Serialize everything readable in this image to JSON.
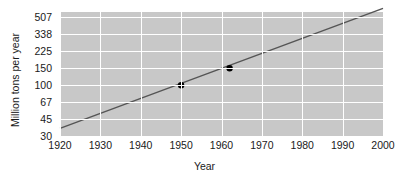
{
  "chart_data": {
    "type": "line",
    "title": "",
    "xlabel": "Year",
    "ylabel": "Million tons per year",
    "y_scale": "log",
    "x_scale": "linear",
    "grid": true,
    "legend": false,
    "xlim": [
      1920,
      2000
    ],
    "ylim": [
      30,
      570
    ],
    "xticks": [
      1920,
      1930,
      1940,
      1950,
      1960,
      1970,
      1980,
      1990,
      2000
    ],
    "xtick_labels": [
      "1920",
      "1930",
      "1940",
      "1950",
      "1960",
      "1970",
      "1980",
      "1990",
      "2000"
    ],
    "yticks": [
      30,
      45,
      67,
      100,
      150,
      225,
      338,
      507
    ],
    "ytick_labels": [
      "30",
      "45",
      "67",
      "100",
      "150",
      "225",
      "338",
      "507"
    ],
    "series": [
      {
        "name": "trend",
        "kind": "line",
        "color": "#555555",
        "x": [
          1920,
          2000
        ],
        "values": [
          36,
          620
        ]
      },
      {
        "name": "data-points",
        "kind": "scatter",
        "color": "#000000",
        "x": [
          1950,
          1962
        ],
        "values": [
          100,
          150
        ]
      }
    ],
    "annotations": []
  },
  "colors": {
    "plot_background": "#c8c8c8",
    "gridline": "#ffffff",
    "page_background": "#ffffff",
    "line": "#555555",
    "marker": "#000000",
    "text": "#1a1a1a"
  }
}
